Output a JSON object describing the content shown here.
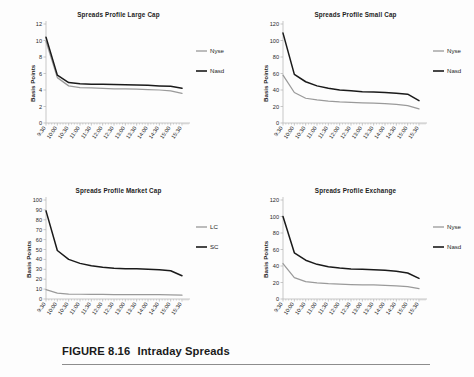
{
  "figure": {
    "caption_number": "FIGURE 8.16",
    "caption_title": "Intraday Spreads"
  },
  "common": {
    "ylabel": "Basis Points",
    "x_categories": [
      "9:30",
      "10:00",
      "10:30",
      "11:00",
      "11:30",
      "12:00",
      "12:30",
      "13:00",
      "13:30",
      "14:00",
      "14:30",
      "15:00",
      "15:30"
    ],
    "colors": {
      "series_gray": "#9a9a9a",
      "series_black": "#1a1a1a",
      "axis": "#b9b9b9",
      "text": "#1c1c1c"
    }
  },
  "chart_data": [
    {
      "id": "large-cap",
      "type": "line",
      "title": "Spreads Profile Large Cap",
      "xlabel": "",
      "ylabel": "Basis Points",
      "ylim": [
        0,
        12
      ],
      "yticks": [
        0,
        2,
        4,
        6,
        8,
        10,
        12
      ],
      "grid": false,
      "legend_position": "right",
      "categories": [
        "9:30",
        "10:00",
        "10:30",
        "11:00",
        "11:30",
        "12:00",
        "12:30",
        "13:00",
        "13:30",
        "14:00",
        "14:30",
        "15:00",
        "15:30"
      ],
      "series": [
        {
          "name": "Nyse",
          "color": "#9a9a9a",
          "values": [
            9.9,
            5.5,
            4.5,
            4.3,
            4.25,
            4.2,
            4.15,
            4.15,
            4.1,
            4.05,
            4.0,
            3.9,
            3.6
          ]
        },
        {
          "name": "Nasd",
          "color": "#1a1a1a",
          "values": [
            10.4,
            5.8,
            4.9,
            4.75,
            4.7,
            4.7,
            4.68,
            4.65,
            4.6,
            4.58,
            4.5,
            4.45,
            4.2
          ]
        }
      ]
    },
    {
      "id": "small-cap",
      "type": "line",
      "title": "Spreads Profile Small Cap",
      "xlabel": "",
      "ylabel": "Basis Points",
      "ylim": [
        0,
        120
      ],
      "yticks": [
        0,
        20,
        40,
        60,
        80,
        100,
        120
      ],
      "grid": false,
      "legend_position": "right",
      "categories": [
        "9:30",
        "10:00",
        "10:30",
        "11:00",
        "11:30",
        "12:00",
        "12:30",
        "13:00",
        "13:30",
        "14:00",
        "14:30",
        "15:00",
        "15:30"
      ],
      "series": [
        {
          "name": "Nyse",
          "color": "#9a9a9a",
          "values": [
            58,
            37,
            30,
            28,
            26.5,
            25.5,
            25,
            24.5,
            24,
            23.5,
            22.5,
            21,
            17
          ]
        },
        {
          "name": "Nasd",
          "color": "#1a1a1a",
          "values": [
            109,
            59,
            50,
            45,
            42,
            40,
            39,
            38,
            37.5,
            37,
            36,
            35,
            27
          ]
        }
      ]
    },
    {
      "id": "market-cap",
      "type": "line",
      "title": "Spreads Profile Market Cap",
      "xlabel": "",
      "ylabel": "Basis Points",
      "ylim": [
        0,
        100
      ],
      "yticks": [
        0,
        10,
        20,
        30,
        40,
        50,
        60,
        70,
        80,
        90,
        100
      ],
      "grid": false,
      "legend_position": "right",
      "categories": [
        "9:30",
        "10:00",
        "10:30",
        "11:00",
        "11:30",
        "12:00",
        "12:30",
        "13:00",
        "13:30",
        "14:00",
        "14:30",
        "15:00",
        "15:30"
      ],
      "series": [
        {
          "name": "LC",
          "color": "#9a9a9a",
          "values": [
            9.5,
            6,
            5,
            4.8,
            4.7,
            4.6,
            4.5,
            4.5,
            4.4,
            4.4,
            4.3,
            4.2,
            3.8
          ]
        },
        {
          "name": "SC",
          "color": "#1a1a1a",
          "values": [
            89,
            49,
            40,
            36,
            33.5,
            32,
            31,
            30.5,
            30.5,
            30,
            29.5,
            28.5,
            23.5
          ]
        }
      ]
    },
    {
      "id": "exchange",
      "type": "line",
      "title": "Spreads Profile Exchange",
      "xlabel": "",
      "ylabel": "Basis Points",
      "ylim": [
        0,
        120
      ],
      "yticks": [
        0,
        20,
        40,
        60,
        80,
        100,
        120
      ],
      "grid": false,
      "legend_position": "right",
      "categories": [
        "9:30",
        "10:00",
        "10:30",
        "11:00",
        "11:30",
        "12:00",
        "12:30",
        "13:00",
        "13:30",
        "14:00",
        "14:30",
        "15:00",
        "15:30"
      ],
      "series": [
        {
          "name": "Nyse",
          "color": "#9a9a9a",
          "values": [
            43,
            26,
            21,
            19.5,
            18.5,
            18,
            17.5,
            17.2,
            17,
            16.5,
            15.8,
            15,
            12.5
          ]
        },
        {
          "name": "Nasd",
          "color": "#1a1a1a",
          "values": [
            100,
            56,
            47,
            42,
            39,
            37.5,
            36.5,
            36,
            35.5,
            35,
            33.5,
            31.5,
            25
          ]
        }
      ]
    }
  ]
}
